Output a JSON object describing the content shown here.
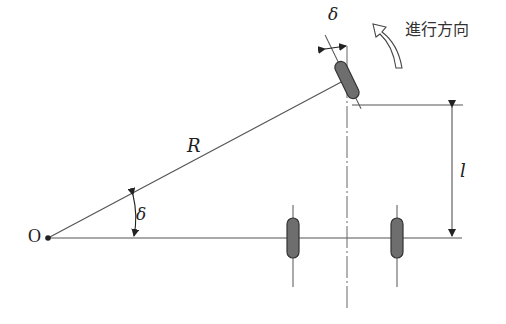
{
  "diagram": {
    "labels": {
      "origin": "O",
      "radius": "R",
      "steer_angle_at_origin": "δ",
      "steer_angle_at_wheel": "δ",
      "wheelbase": "l",
      "travel_direction": "進行方向"
    },
    "colors": {
      "line": "#555555",
      "wheel_fill": "#6e6e6e",
      "wheel_stroke": "#333333",
      "text": "#222222"
    }
  }
}
